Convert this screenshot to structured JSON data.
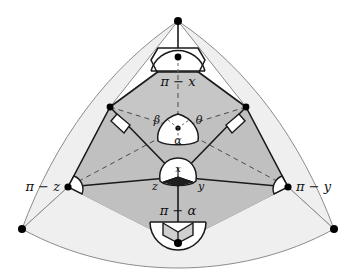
{
  "figure": {
    "name": "spherical-polyhedron-angle-diagram",
    "background": "#ffffff",
    "colors": {
      "outer_fill": "#efefef",
      "inner_fill": "#c6c6c6",
      "mid_fill": "#d8d8d8",
      "stroke_dark": "#1a1a1a",
      "stroke_light": "#8c8c8c",
      "vertex_dot": "#000000",
      "label": "#111111"
    }
  },
  "labels": {
    "top": "π − x",
    "bottom": "π − α",
    "left": "π − z",
    "right": "π − y",
    "center_left": "β",
    "center_right": "θ",
    "center_bottom": "α",
    "lower_top": "x",
    "lower_left": "z",
    "lower_right": "y"
  },
  "annotations": {
    "right_angle_marker_left": "right-angle",
    "right_angle_marker_right": "right-angle",
    "right_angle_marker_lower_left": "right-angle",
    "right_angle_marker_lower_right": "right-angle"
  },
  "vertices": {
    "apex": [
      178,
      21
    ],
    "upper_inner": [
      178,
      57
    ],
    "shoulder_left": [
      110,
      107
    ],
    "shoulder_right": [
      246,
      107
    ],
    "center": [
      178,
      128
    ],
    "node_lower": [
      178,
      177
    ],
    "corner_left": [
      68,
      187
    ],
    "corner_right": [
      288,
      187
    ],
    "base": [
      178,
      243
    ],
    "outer_left": [
      22,
      229
    ],
    "outer_right": [
      334,
      229
    ]
  }
}
